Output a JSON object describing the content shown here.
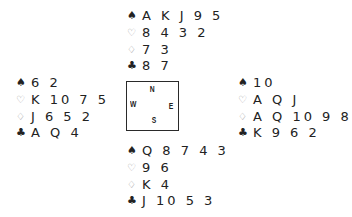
{
  "suit_symbols": {
    "spades": "♠",
    "hearts": "♡",
    "diamonds": "♢",
    "clubs": "♣"
  },
  "compass": {
    "north": "N",
    "east": "E",
    "south": "S",
    "west": "W"
  },
  "hands": {
    "north": {
      "spades": "A K J 9 5",
      "hearts": "8 4 3 2",
      "diamonds": "7 3",
      "clubs": "8 7"
    },
    "west": {
      "spades": "6 2",
      "hearts": "K 10 7 5",
      "diamonds": "J 6 5 2",
      "clubs": "A Q 4"
    },
    "east": {
      "spades": "10",
      "hearts": "A Q J",
      "diamonds": "A Q 10 9 8",
      "clubs": "K 9 6 2"
    },
    "south": {
      "spades": "Q 8 7 4 3",
      "hearts": "9 6",
      "diamonds": "K 4",
      "clubs": "J 10 5 3"
    }
  },
  "colors": {
    "text": "#222222",
    "red_suit_outline": "#9a9a9a",
    "box_border": "#2a2a2a"
  }
}
